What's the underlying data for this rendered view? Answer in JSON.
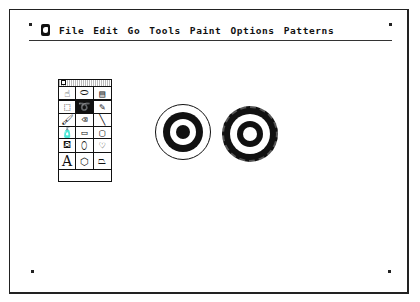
{
  "menubar": {
    "apple_icon": "apple-icon",
    "items": [
      "File",
      "Edit",
      "Go",
      "Tools",
      "Paint",
      "Options",
      "Patterns"
    ]
  },
  "tool_palette": {
    "tools": [
      {
        "name": "browse-hand",
        "glyph": "☝"
      },
      {
        "name": "button",
        "glyph": "⬭"
      },
      {
        "name": "field",
        "glyph": "▤"
      },
      {
        "name": "select",
        "glyph": "⬚"
      },
      {
        "name": "lasso",
        "glyph": "➰",
        "selected": true
      },
      {
        "name": "pencil",
        "glyph": "✎"
      },
      {
        "name": "brush",
        "glyph": "🖌"
      },
      {
        "name": "eraser",
        "glyph": "⌫"
      },
      {
        "name": "line",
        "glyph": "╲"
      },
      {
        "name": "spray",
        "glyph": "🧴"
      },
      {
        "name": "rectangle",
        "glyph": "▭"
      },
      {
        "name": "round-rect",
        "glyph": "▢"
      },
      {
        "name": "bucket",
        "glyph": "⛾"
      },
      {
        "name": "oval",
        "glyph": "⬯"
      },
      {
        "name": "curve",
        "glyph": "♡"
      },
      {
        "name": "text",
        "glyph": "A"
      },
      {
        "name": "regular-polygon",
        "glyph": "⬡"
      },
      {
        "name": "polygon",
        "glyph": "⏢"
      }
    ]
  },
  "canvas": {
    "shapes": [
      "smooth-target",
      "rough-target"
    ],
    "colors": {
      "ink": "#111111",
      "paper": "#ffffff"
    }
  }
}
